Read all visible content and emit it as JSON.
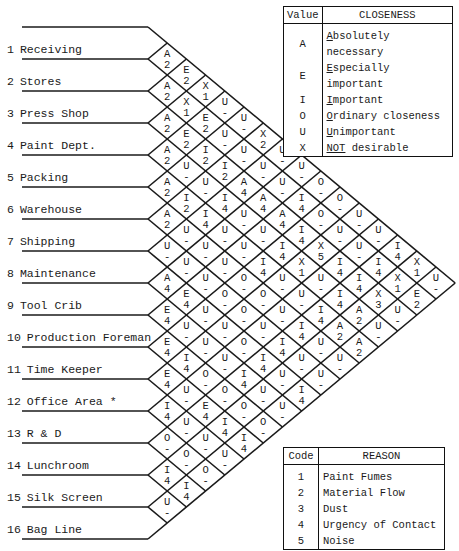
{
  "departments": [
    {
      "num": "1",
      "name": "Receiving"
    },
    {
      "num": "2",
      "name": "Stores"
    },
    {
      "num": "3",
      "name": "Press Shop"
    },
    {
      "num": "4",
      "name": "Paint Dept."
    },
    {
      "num": "5",
      "name": "Packing"
    },
    {
      "num": "6",
      "name": "Warehouse"
    },
    {
      "num": "7",
      "name": "Shipping"
    },
    {
      "num": "8",
      "name": "Maintenance"
    },
    {
      "num": "9",
      "name": "Tool Crib"
    },
    {
      "num": "10",
      "name": "Production Foreman"
    },
    {
      "num": "11",
      "name": "Time Keeper"
    },
    {
      "num": "12",
      "name": "Office Area *"
    },
    {
      "num": "13",
      "name": "R & D"
    },
    {
      "num": "14",
      "name": "Lunchroom"
    },
    {
      "num": "15",
      "name": "Silk Screen"
    },
    {
      "num": "16",
      "name": "Bag Line"
    }
  ],
  "relationships": [
    [
      "A2",
      "E2",
      "X1",
      "U-",
      "U-",
      "X2",
      "U-",
      "U-",
      "O-",
      "O-",
      "U-",
      "U-",
      "I4",
      "X1",
      "U-"
    ],
    [
      "A2",
      "X1",
      "E2",
      "U-",
      "U-",
      "U-",
      "U-",
      "I4",
      "O-",
      "U-",
      "U-",
      "I4",
      "X1",
      "E2"
    ],
    [
      "A2",
      "E2",
      "I2",
      "I2",
      "A4",
      "A4",
      "A4",
      "I4",
      "X5",
      "I4",
      "I4",
      "X3",
      "U-"
    ],
    [
      "A2",
      "U-",
      "U-",
      "I4",
      "U-",
      "U-",
      "I4",
      "X1",
      "U-",
      "I4",
      "A2",
      "U-"
    ],
    [
      "A2",
      "I2",
      "I4",
      "U-",
      "U-",
      "I4",
      "U-",
      "U-",
      "I4",
      "A2",
      "A2"
    ],
    [
      "A2",
      "U-",
      "U-",
      "U-",
      "O-",
      "O-",
      "U-",
      "I4",
      "U-",
      "U-"
    ],
    [
      "U-",
      "U-",
      "U-",
      "O-",
      "O-",
      "U-",
      "I4",
      "U-",
      "U-"
    ],
    [
      "A4",
      "E4",
      "U-",
      "U-",
      "O-",
      "I4",
      "U-",
      "I4"
    ],
    [
      "E4",
      "U-",
      "U-",
      "U-",
      "I4",
      "U-",
      "U-"
    ],
    [
      "E4",
      "I4",
      "O-",
      "O-",
      "O-",
      "O-"
    ],
    [
      "E4",
      "U-",
      "E4",
      "I4",
      "I4"
    ],
    [
      "I4",
      "U-",
      "U-",
      "U-"
    ],
    [
      "O-",
      "O-",
      "O-"
    ],
    [
      "I4",
      "I4"
    ],
    [
      "U-"
    ]
  ],
  "closeness_legend": {
    "header_value": "Value",
    "header_label": "CLOSENESS",
    "rows": [
      {
        "value": "A",
        "first": "A",
        "rest": "bsolutely necessary"
      },
      {
        "value": "E",
        "first": "E",
        "rest": "specially important"
      },
      {
        "value": "I",
        "first": "I",
        "rest": "mportant"
      },
      {
        "value": "O",
        "first": "O",
        "rest": "rdinary closeness"
      },
      {
        "value": "U",
        "first": "U",
        "rest": "nimportant"
      },
      {
        "value": "X",
        "first": "NOT",
        "rest": " desirable"
      }
    ]
  },
  "reason_legend": {
    "header_code": "Code",
    "header_label": "REASON",
    "rows": [
      {
        "code": "1",
        "reason": "Paint Fumes"
      },
      {
        "code": "2",
        "reason": "Material Flow"
      },
      {
        "code": "3",
        "reason": "Dust"
      },
      {
        "code": "4",
        "reason": "Urgency of Contact"
      },
      {
        "code": "5",
        "reason": "Noise"
      }
    ]
  },
  "colors": {
    "ink": "#1a1a1a",
    "background": "#ffffff"
  }
}
